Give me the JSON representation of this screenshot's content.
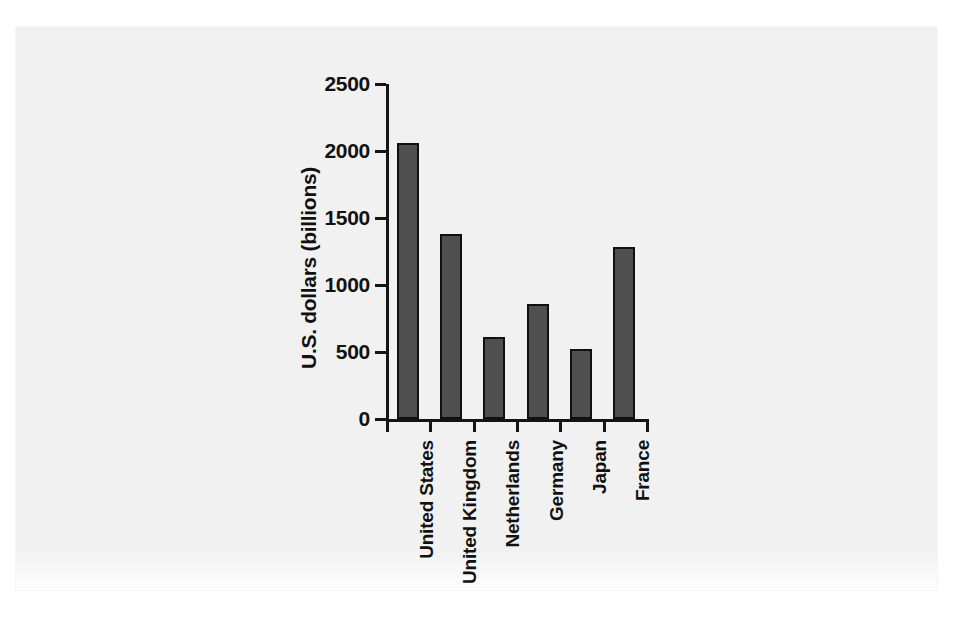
{
  "figure": {
    "background_color": "#ffffff",
    "panel_color": "#f1f1f1",
    "bar_fill_color": "#4f4f4f",
    "bar_edge_color": "#101010",
    "axis_color": "#141414",
    "text_color": "#111111"
  },
  "chart_data": {
    "type": "bar",
    "title": "",
    "subtitle": "",
    "xlabel": "",
    "ylabel": "U.S. dollars (billions)",
    "categories": [
      "United States",
      "United Kingdom",
      "Netherlands",
      "Germany",
      "Japan",
      "France"
    ],
    "values": [
      2060,
      1380,
      610,
      860,
      520,
      1280
    ],
    "series": [
      {
        "name": "Foreign direct investment",
        "values": [
          2060,
          1380,
          610,
          860,
          520,
          1280
        ]
      }
    ],
    "ylim": [
      0,
      2500
    ],
    "yticks": [
      0,
      500,
      1000,
      1500,
      2000,
      2500
    ],
    "ytick_labels": [
      "0",
      "500",
      "1000",
      "1500",
      "2000",
      "2500"
    ],
    "grid": false,
    "legend": null,
    "legend_position": "none",
    "annotations": [],
    "orientation": "vertical",
    "xtick_label_rotation": -90
  }
}
